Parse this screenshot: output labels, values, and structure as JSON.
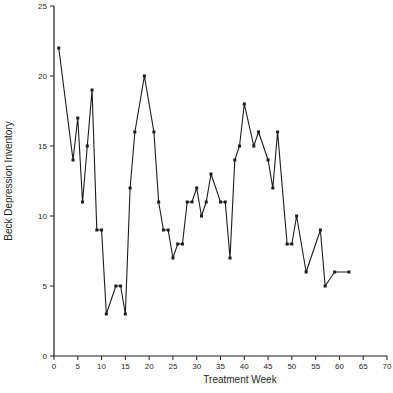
{
  "figure": {
    "background_color": "#ffffff",
    "line_color": "#1c1c1c",
    "marker_color": "#1c1c1c",
    "axis_color": "#1c1c1c",
    "text_color": "#1f1f1f"
  },
  "chart_data": {
    "type": "line",
    "title": "",
    "xlabel": "Treatment Week",
    "ylabel": "Beck Depression Inventory",
    "xlim": [
      0,
      70
    ],
    "ylim": [
      0,
      25
    ],
    "x_ticks": [
      0,
      5,
      10,
      15,
      20,
      25,
      30,
      35,
      40,
      45,
      50,
      55,
      60,
      65,
      70
    ],
    "y_ticks": [
      0,
      5,
      10,
      15,
      20,
      25
    ],
    "grid": false,
    "legend": "none",
    "marker": "square",
    "series": [
      {
        "name": "Beck Depression Inventory score",
        "x": [
          1,
          4,
          5,
          6,
          7,
          8,
          9,
          10,
          11,
          13,
          14,
          15,
          16,
          17,
          19,
          21,
          22,
          23,
          24,
          25,
          26,
          27,
          28,
          29,
          30,
          31,
          32,
          33,
          35,
          36,
          37,
          38,
          39,
          40,
          42,
          43,
          45,
          46,
          47,
          49,
          50,
          51,
          53,
          56,
          57,
          59,
          62
        ],
        "y": [
          22,
          14,
          17,
          11,
          15,
          19,
          9,
          9,
          3,
          5,
          5,
          3,
          12,
          16,
          20,
          16,
          11,
          9,
          9,
          7,
          8,
          8,
          11,
          11,
          12,
          10,
          11,
          13,
          11,
          11,
          7,
          14,
          15,
          18,
          15,
          16,
          14,
          12,
          16,
          8,
          8,
          10,
          6,
          9,
          5,
          6,
          6
        ]
      }
    ]
  }
}
